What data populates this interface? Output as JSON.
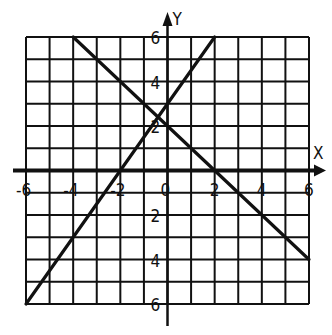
{
  "chart_data": {
    "type": "line",
    "title": "",
    "xlabel": "X",
    "ylabel": "Y",
    "xlim": [
      -6,
      6
    ],
    "ylim": [
      -6,
      6
    ],
    "grid": true,
    "grid_step": 1,
    "x_tick_labels": [
      "-6",
      "-4",
      "-2",
      "0",
      "2",
      "4",
      "6"
    ],
    "y_tick_labels": [
      "6",
      "4",
      "2",
      "2",
      "4",
      "6"
    ],
    "y_tick_values": [
      6,
      4,
      2,
      -2,
      -4,
      -6
    ],
    "series": [
      {
        "name": "line-increasing",
        "equation": "y = 1.5x + 3",
        "points": [
          [
            -6,
            -6
          ],
          [
            2,
            6
          ]
        ]
      },
      {
        "name": "line-decreasing",
        "equation": "y = -x + 2",
        "points": [
          [
            -4,
            6
          ],
          [
            6,
            -4
          ]
        ]
      }
    ],
    "legend": "none"
  },
  "colors": {
    "ink": "#111111",
    "background": "#ffffff"
  }
}
